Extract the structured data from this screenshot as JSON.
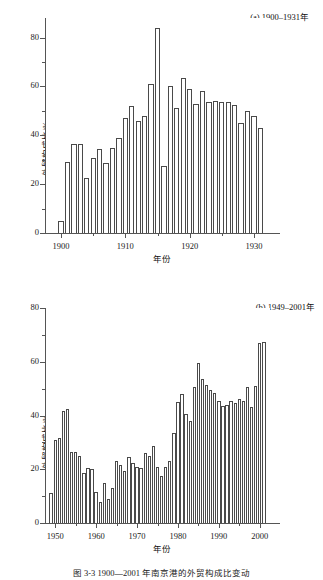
{
  "figure": {
    "caption": "图 3-3  1900—2001 年南京港的外贸构成比变动"
  },
  "chart_data": [
    {
      "id": "panel-a",
      "type": "bar",
      "title": "(a) 1900–1931年",
      "xlabel": "年份",
      "ylabel": "外贸构成比/%",
      "ylim": [
        0,
        88
      ],
      "xlim": [
        1897.5,
        1932.5
      ],
      "yticks": [
        0,
        20,
        40,
        60,
        80
      ],
      "yticklabels": [
        "0",
        "20",
        "40",
        "60",
        "80"
      ],
      "yminorticks": [
        10,
        30,
        50,
        70
      ],
      "xticks": [
        1900,
        1910,
        1920,
        1930
      ],
      "xticklabels": [
        "1900",
        "1910",
        "1920",
        "1930"
      ],
      "xminorticks": [
        1905,
        1915,
        1925
      ],
      "grid": false,
      "legend": "none",
      "categories": [
        1900,
        1901,
        1902,
        1903,
        1904,
        1905,
        1906,
        1907,
        1908,
        1909,
        1910,
        1911,
        1912,
        1913,
        1914,
        1915,
        1916,
        1917,
        1918,
        1919,
        1920,
        1921,
        1922,
        1923,
        1924,
        1925,
        1926,
        1927,
        1928,
        1929,
        1930,
        1931
      ],
      "values": [
        5,
        29,
        36.5,
        36.5,
        22.5,
        30.5,
        34.5,
        28.5,
        35,
        39,
        47,
        52,
        46,
        48,
        61,
        84,
        27.5,
        60,
        51,
        63.5,
        59,
        53,
        58,
        53.5,
        54,
        53.5,
        53.5,
        52.5,
        45,
        50,
        48,
        43
      ]
    },
    {
      "id": "panel-b",
      "type": "bar",
      "title": "(b) 1949–2001年",
      "xlabel": "年份",
      "ylabel": "外贸构成比/%",
      "ylim": [
        0,
        80
      ],
      "xlim": [
        1947.5,
        2002.5
      ],
      "yticks": [
        0,
        20,
        40,
        60,
        80
      ],
      "yticklabels": [
        "0",
        "20",
        "40",
        "60",
        "80"
      ],
      "yminorticks": [
        10,
        30,
        50,
        70
      ],
      "xticks": [
        1950,
        1960,
        1970,
        1980,
        1990,
        2000
      ],
      "xticklabels": [
        "1950",
        "1960",
        "1970",
        "1980",
        "1990",
        "2000"
      ],
      "xminorticks": [
        1955,
        1965,
        1975,
        1985,
        1995
      ],
      "grid": false,
      "legend": "none",
      "categories": [
        1949,
        1950,
        1951,
        1952,
        1953,
        1954,
        1955,
        1956,
        1957,
        1958,
        1959,
        1960,
        1961,
        1962,
        1963,
        1964,
        1965,
        1966,
        1967,
        1968,
        1969,
        1970,
        1971,
        1972,
        1973,
        1974,
        1975,
        1976,
        1977,
        1978,
        1979,
        1980,
        1981,
        1982,
        1983,
        1984,
        1985,
        1986,
        1987,
        1988,
        1989,
        1990,
        1991,
        1992,
        1993,
        1994,
        1995,
        1996,
        1997,
        1998,
        1999,
        2000,
        2001
      ],
      "values": [
        11,
        31,
        31.5,
        41.5,
        42.5,
        26.5,
        26.5,
        25,
        18.5,
        20.5,
        20,
        11.5,
        8,
        15,
        9,
        13,
        23,
        21.5,
        19.5,
        24.5,
        22.5,
        21,
        20.5,
        26,
        25,
        28.5,
        21,
        17.5,
        21,
        23,
        33.5,
        45,
        48,
        40.5,
        38,
        50.5,
        59.5,
        53.5,
        51.5,
        49.5,
        48.5,
        45.5,
        43.5,
        44,
        45.5,
        44.5,
        46,
        45.5,
        50.5,
        43,
        51,
        67,
        67.5
      ]
    }
  ]
}
